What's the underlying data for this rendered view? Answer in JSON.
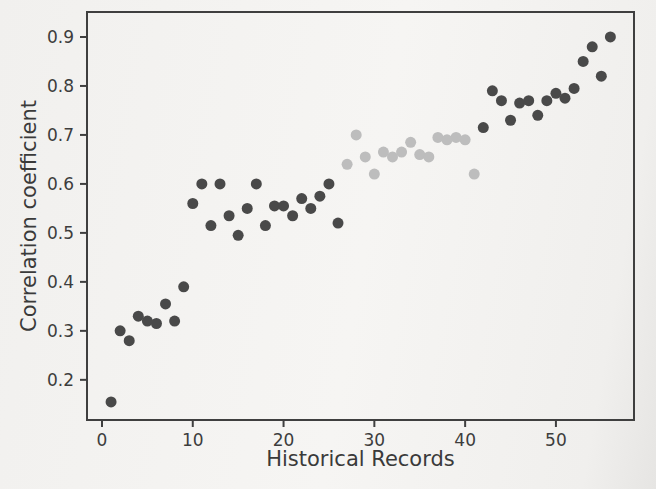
{
  "chart_data": {
    "type": "scatter",
    "title": "",
    "xlabel": "Historical Records",
    "ylabel": "Correlation coefficient",
    "xlim": [
      -1.65,
      58.6
    ],
    "ylim": [
      0.118,
      0.951
    ],
    "x_ticks": [
      0,
      10,
      20,
      30,
      40,
      50
    ],
    "x_tick_labels": [
      "0",
      "10",
      "20",
      "30",
      "40",
      "50"
    ],
    "y_ticks": [
      0.2,
      0.3,
      0.4,
      0.5,
      0.6,
      0.7,
      0.8,
      0.9
    ],
    "y_tick_labels": [
      "0.2",
      "0.3",
      "0.4",
      "0.5",
      "0.6",
      "0.7",
      "0.8",
      "0.9"
    ],
    "grid": false,
    "legend": "none",
    "marker_radius_px": 5.5,
    "series": [
      {
        "name": "dark-gray-points",
        "color": "#4a4a4a",
        "points": [
          [
            1,
            0.155
          ],
          [
            2,
            0.3
          ],
          [
            3,
            0.28
          ],
          [
            4,
            0.33
          ],
          [
            5,
            0.32
          ],
          [
            6,
            0.315
          ],
          [
            7,
            0.355
          ],
          [
            8,
            0.32
          ],
          [
            9,
            0.39
          ],
          [
            10,
            0.56
          ],
          [
            11,
            0.6
          ],
          [
            12,
            0.515
          ],
          [
            13,
            0.6
          ],
          [
            14,
            0.535
          ],
          [
            15,
            0.495
          ],
          [
            16,
            0.55
          ],
          [
            17,
            0.6
          ],
          [
            18,
            0.515
          ],
          [
            19,
            0.555
          ],
          [
            20,
            0.555
          ],
          [
            21,
            0.535
          ],
          [
            22,
            0.57
          ],
          [
            23,
            0.55
          ],
          [
            24,
            0.575
          ],
          [
            25,
            0.6
          ],
          [
            26,
            0.52
          ],
          [
            42,
            0.715
          ],
          [
            43,
            0.79
          ],
          [
            44,
            0.77
          ],
          [
            45,
            0.73
          ],
          [
            46,
            0.765
          ],
          [
            47,
            0.77
          ],
          [
            48,
            0.74
          ],
          [
            49,
            0.77
          ],
          [
            50,
            0.785
          ],
          [
            51,
            0.775
          ],
          [
            52,
            0.795
          ],
          [
            53,
            0.85
          ],
          [
            54,
            0.88
          ],
          [
            55,
            0.82
          ],
          [
            56,
            0.9
          ]
        ]
      },
      {
        "name": "light-gray-points",
        "color": "#bdbdbd",
        "points": [
          [
            27,
            0.64
          ],
          [
            28,
            0.7
          ],
          [
            29,
            0.655
          ],
          [
            30,
            0.62
          ],
          [
            31,
            0.665
          ],
          [
            32,
            0.655
          ],
          [
            33,
            0.665
          ],
          [
            34,
            0.685
          ],
          [
            35,
            0.66
          ],
          [
            36,
            0.655
          ],
          [
            37,
            0.695
          ],
          [
            38,
            0.69
          ],
          [
            39,
            0.695
          ],
          [
            40,
            0.69
          ],
          [
            41,
            0.62
          ]
        ]
      }
    ]
  },
  "colors": {
    "axis": "#3f3f3f",
    "text": "#3a3a3a",
    "background": "#f4f3f1"
  }
}
